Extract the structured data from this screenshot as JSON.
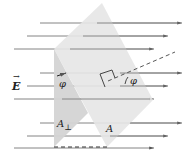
{
  "labels": {
    "field": "E",
    "angle_left": "φ",
    "angle_right": "φ",
    "area_perp": "A",
    "area_perp_sub": "⊥",
    "area": "A"
  },
  "colors": {
    "plane": "#e4e4e4",
    "plane_perp": "#d6d6d6",
    "field_lines": "#555555"
  }
}
